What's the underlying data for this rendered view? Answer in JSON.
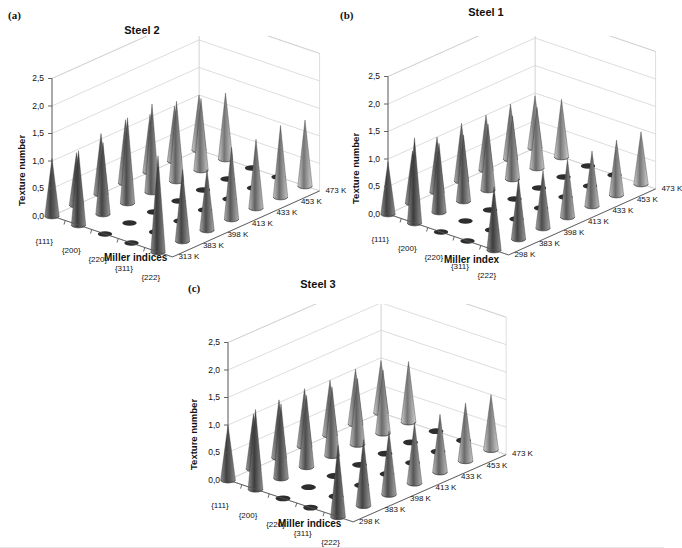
{
  "figure": {
    "width": 664,
    "height": 548,
    "background": "#ffffff",
    "panel_count": 3
  },
  "panels": [
    {
      "tag": "(a)",
      "title": "Steel 2",
      "ylabel": "Texture number",
      "xlabel": "Miller indices",
      "yticks": [
        "0,0",
        "0,5",
        "1,0",
        "1,5",
        "2,0",
        "2,5"
      ],
      "xticks": [
        "{111}",
        "{200}",
        "{220}",
        "{311}",
        "{222}"
      ],
      "zticks": [
        "473 K",
        "453 K",
        "433 K",
        "413 K",
        "398 K",
        "383 K",
        "313 K"
      ]
    },
    {
      "tag": "(b)",
      "title": "Steel 1",
      "ylabel": "Texture number",
      "xlabel": "Miller index",
      "yticks": [
        "0,0",
        "0,5",
        "1,0",
        "1,5",
        "2,0",
        "2,5"
      ],
      "xticks": [
        "{111}",
        "{200}",
        "{220}",
        "{311}",
        "{222}"
      ],
      "zticks": [
        "473 K",
        "453 K",
        "433 K",
        "413 K",
        "398 K",
        "383 K",
        "298 K"
      ]
    },
    {
      "tag": "(c)",
      "title": "Steel 3",
      "ylabel": "Texture number",
      "xlabel": "Miller indices",
      "yticks": [
        "0,0",
        "0,5",
        "1,0",
        "1,5",
        "2,0",
        "2,5"
      ],
      "xticks": [
        "{111}",
        "{200}",
        "{220}",
        "{311}",
        "{222}"
      ],
      "zticks": [
        "473 K",
        "453 K",
        "433 K",
        "413 K",
        "398 K",
        "383 K",
        "298 K"
      ]
    }
  ],
  "chart_data": [
    {
      "type": "bar",
      "title": "Steel 2",
      "panel": "(a)",
      "render": "3d-cone-surface",
      "xlabel": "Miller indices",
      "ylabel": "Texture number",
      "zlabel": "Temperature",
      "categories": [
        "{111}",
        "{200}",
        "{220}",
        "{311}",
        "{222}"
      ],
      "z_categories": [
        "313 K",
        "383 K",
        "398 K",
        "413 K",
        "433 K",
        "453 K",
        "473 K"
      ],
      "ylim": [
        0,
        2.5
      ],
      "grid": true,
      "legend": "none",
      "series": [
        {
          "name": "313 K",
          "values": [
            1.05,
            1.35,
            0.0,
            0.0,
            1.75
          ]
        },
        {
          "name": "383 K",
          "values": [
            0.95,
            1.3,
            0.0,
            0.0,
            1.3
          ]
        },
        {
          "name": "398 K",
          "values": [
            1.1,
            1.55,
            0.0,
            0.0,
            1.1
          ]
        },
        {
          "name": "413 K",
          "values": [
            1.15,
            1.6,
            0.0,
            0.0,
            1.3
          ]
        },
        {
          "name": "433 K",
          "values": [
            1.05,
            1.45,
            0.0,
            0.0,
            1.25
          ]
        },
        {
          "name": "453 K",
          "values": [
            1.0,
            1.3,
            0.0,
            0.0,
            1.3
          ]
        },
        {
          "name": "473 K",
          "values": [
            1.0,
            1.2,
            0.0,
            0.0,
            1.2
          ]
        }
      ]
    },
    {
      "type": "bar",
      "title": "Steel 1",
      "panel": "(b)",
      "render": "3d-cone-surface",
      "xlabel": "Miller index",
      "ylabel": "Texture number",
      "zlabel": "Temperature",
      "categories": [
        "{111}",
        "{200}",
        "{220}",
        "{311}",
        "{222}"
      ],
      "z_categories": [
        "298 K",
        "383 K",
        "398 K",
        "413 K",
        "433 K",
        "453 K",
        "473 K"
      ],
      "ylim": [
        0,
        2.5
      ],
      "grid": true,
      "legend": "none",
      "series": [
        {
          "name": "298 K",
          "values": [
            0.95,
            1.55,
            0.0,
            0.0,
            1.15
          ]
        },
        {
          "name": "383 K",
          "values": [
            0.95,
            1.25,
            0.0,
            0.0,
            1.1
          ]
        },
        {
          "name": "398 K",
          "values": [
            1.0,
            1.2,
            0.0,
            0.0,
            1.05
          ]
        },
        {
          "name": "413 K",
          "values": [
            1.05,
            1.2,
            0.0,
            0.0,
            1.05
          ]
        },
        {
          "name": "433 K",
          "values": [
            1.0,
            1.15,
            0.0,
            0.0,
            1.0
          ]
        },
        {
          "name": "453 K",
          "values": [
            1.0,
            1.1,
            0.0,
            0.0,
            1.0
          ]
        },
        {
          "name": "473 K",
          "values": [
            0.95,
            1.05,
            0.0,
            0.0,
            0.95
          ]
        }
      ]
    },
    {
      "type": "bar",
      "title": "Steel 3",
      "panel": "(c)",
      "render": "3d-cone-surface",
      "xlabel": "Miller indices",
      "ylabel": "Texture number",
      "zlabel": "Temperature",
      "categories": [
        "{111}",
        "{200}",
        "{220}",
        "{311}",
        "{222}"
      ],
      "z_categories": [
        "298 K",
        "383 K",
        "398 K",
        "413 K",
        "433 K",
        "453 K",
        "473 K"
      ],
      "ylim": [
        0,
        2.5
      ],
      "grid": true,
      "legend": "none",
      "series": [
        {
          "name": "298 K",
          "values": [
            1.0,
            1.45,
            0.0,
            0.0,
            1.3
          ]
        },
        {
          "name": "383 K",
          "values": [
            1.0,
            1.35,
            0.0,
            0.0,
            1.2
          ]
        },
        {
          "name": "398 K",
          "values": [
            1.05,
            1.3,
            0.0,
            0.0,
            1.15
          ]
        },
        {
          "name": "413 K",
          "values": [
            1.05,
            1.25,
            0.0,
            0.0,
            1.1
          ]
        },
        {
          "name": "433 K",
          "values": [
            1.0,
            1.2,
            0.0,
            0.0,
            1.05
          ]
        },
        {
          "name": "453 K",
          "values": [
            1.0,
            1.15,
            0.0,
            0.0,
            1.05
          ]
        },
        {
          "name": "473 K",
          "values": [
            0.95,
            1.1,
            0.0,
            0.0,
            1.0
          ]
        }
      ]
    }
  ]
}
